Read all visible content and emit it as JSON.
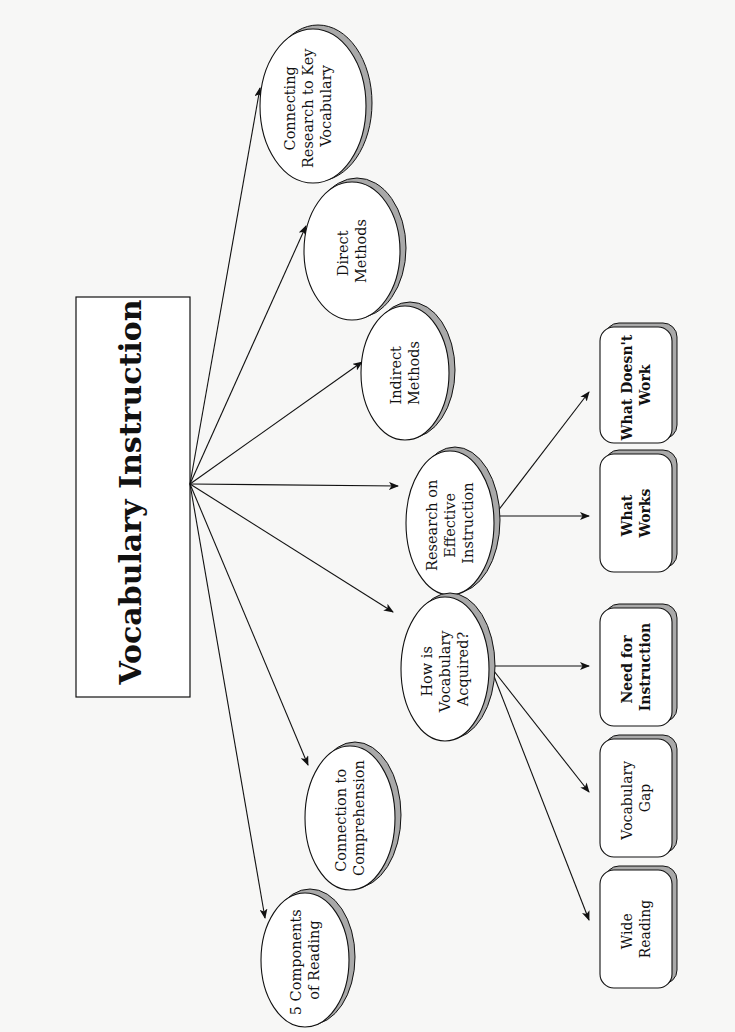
{
  "diagram": {
    "title": "Vocabulary Instruction",
    "colors": {
      "background": "#f7f7f6",
      "stroke": "#111111",
      "shadow": "#a9a9a9",
      "fill": "#ffffff"
    },
    "topics": [
      {
        "id": "connecting",
        "lines": [
          "Connecting",
          "Research to Key",
          "Vocabulary"
        ]
      },
      {
        "id": "direct",
        "lines": [
          "Direct",
          "Methods"
        ]
      },
      {
        "id": "indirect",
        "lines": [
          "Indirect",
          "Methods"
        ]
      },
      {
        "id": "research",
        "lines": [
          "Research on",
          "Effective",
          "Instruction"
        ]
      },
      {
        "id": "acquired",
        "lines": [
          "How is",
          "Vocabulary",
          "Acquired?"
        ]
      },
      {
        "id": "comprehension",
        "lines": [
          "Connection to",
          "Comprehension"
        ]
      },
      {
        "id": "components",
        "lines": [
          "5 Components",
          "of Reading"
        ]
      }
    ],
    "subtopics": [
      {
        "id": "doesnt-work",
        "parent": "research",
        "lines": [
          "What Doesn't",
          "Work"
        ]
      },
      {
        "id": "works",
        "parent": "research",
        "lines": [
          "What",
          "Works"
        ]
      },
      {
        "id": "need",
        "parent": "acquired",
        "lines": [
          "Need for",
          "Instruction"
        ]
      },
      {
        "id": "gap",
        "parent": "acquired",
        "lines": [
          "Vocabulary",
          "Gap"
        ]
      },
      {
        "id": "wide",
        "parent": "acquired",
        "lines": [
          "Wide",
          "Reading"
        ]
      }
    ]
  }
}
